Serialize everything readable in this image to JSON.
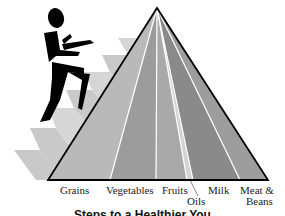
{
  "figure": {
    "type": "food-pyramid",
    "caption": "Steps to a Healthier You",
    "colors": {
      "stairs_side": "#c9c9c9",
      "stairs_top": "#ffffff",
      "figure": "#000000",
      "outline": "#000000",
      "separator": "#ffffff"
    },
    "groups": [
      {
        "label": "Grains",
        "color": "#b9b9b9"
      },
      {
        "label": "Vegetables",
        "color": "#9c9c9c"
      },
      {
        "label": "Fruits",
        "color": "#a9a9a9"
      },
      {
        "label": "Oils",
        "color": "#d4d4d4"
      },
      {
        "label": "Milk",
        "color": "#8a8a8a"
      },
      {
        "label": "Meat &",
        "label2": "Beans",
        "color": "#9d9d9d"
      }
    ]
  }
}
